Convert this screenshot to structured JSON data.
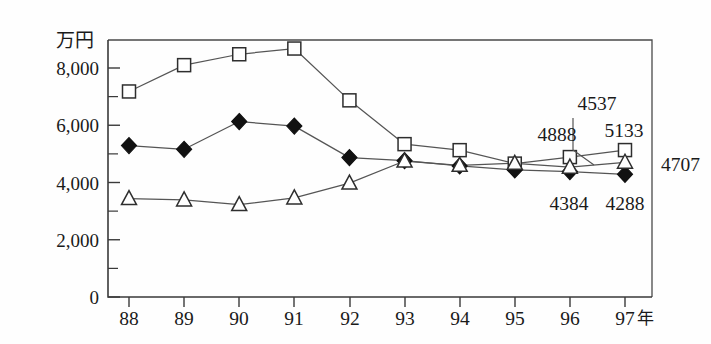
{
  "chart_data": {
    "type": "line",
    "title": "",
    "subtitle": "",
    "xlabel": "年",
    "ylabel": "万円",
    "x": [
      "88",
      "89",
      "90",
      "91",
      "92",
      "93",
      "94",
      "95",
      "96",
      "97"
    ],
    "categories": [
      "88",
      "89",
      "90",
      "91",
      "92",
      "93",
      "94",
      "95",
      "96",
      "97"
    ],
    "xtick_labels": [
      "88",
      "89",
      "90",
      "91",
      "92",
      "93",
      "94",
      "95",
      "96",
      "97"
    ],
    "ytick_labels": [
      "0",
      "2,000",
      "4,000",
      "6,000",
      "8,000"
    ],
    "ytick_values": [
      0,
      2000,
      4000,
      6000,
      8000
    ],
    "ylim": [
      0,
      9300
    ],
    "xlim_years": [
      88,
      97
    ],
    "minor_tick_step": 1000,
    "grid": false,
    "legend": "none",
    "legend_position": "none",
    "series": [
      {
        "name": "square",
        "marker": "open-square",
        "values": [
          7180,
          8100,
          8480,
          8680,
          6870,
          5340,
          5130,
          4660,
          4888,
          5133
        ]
      },
      {
        "name": "diamond",
        "marker": "filled-diamond",
        "values": [
          5290,
          5160,
          6130,
          5970,
          4870,
          4760,
          4580,
          4440,
          4384,
          4288
        ]
      },
      {
        "name": "triangle",
        "marker": "open-triangle",
        "values": [
          3440,
          3390,
          3230,
          3460,
          3980,
          4750,
          4600,
          4670,
          4537,
          4707
        ]
      }
    ],
    "annotations": [
      {
        "text": "4537",
        "series": "triangle",
        "x": "96",
        "value": 4537,
        "has_leader": true
      },
      {
        "text": "4888",
        "series": "square",
        "x": "96",
        "value": 4888,
        "has_leader": false
      },
      {
        "text": "5133",
        "series": "square",
        "x": "97",
        "value": 5133,
        "has_leader": false
      },
      {
        "text": "4707",
        "series": "triangle",
        "x": "97",
        "value": 4707,
        "has_leader": false
      },
      {
        "text": "4384",
        "series": "diamond",
        "x": "96",
        "value": 4384,
        "has_leader": false
      },
      {
        "text": "4288",
        "series": "diamond",
        "x": "97",
        "value": 4288,
        "has_leader": false
      }
    ],
    "colors": {
      "axis": "#3a3a3a",
      "line": "#555555",
      "marker_fill_open": "#ffffff",
      "marker_fill_solid": "#111111",
      "marker_stroke": "#2e2e2e",
      "background": "#fefefe",
      "text": "#1a1a1a"
    }
  },
  "axis": {
    "y_unit": "万円",
    "x_unit": "年"
  },
  "ylabels": {
    "t0": "0",
    "t2000": "2,000",
    "t4000": "4,000",
    "t6000": "6,000",
    "t8000": "8,000"
  },
  "xlabels": {
    "y88": "88",
    "y89": "89",
    "y90": "90",
    "y91": "91",
    "y92": "92",
    "y93": "93",
    "y94": "94",
    "y95": "95",
    "y96": "96",
    "y97": "97"
  },
  "annotations": {
    "a4537": "4537",
    "a4888": "4888",
    "a5133": "5133",
    "a4707": "4707",
    "a4384": "4384",
    "a4288": "4288"
  }
}
